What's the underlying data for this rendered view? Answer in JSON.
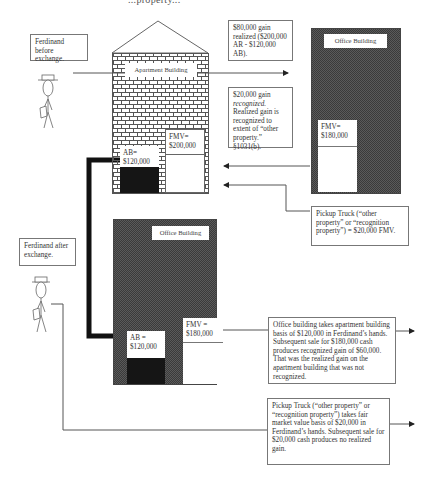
{
  "header": {
    "partial_title": "...property..."
  },
  "before": {
    "person_label": "Ferdinand before exchange.",
    "apartment": {
      "label": "Apartment Building",
      "fmv_label": "FMV=",
      "fmv_value": "$200,000",
      "ab_label": "AB=",
      "ab_value": "$120,000"
    },
    "office": {
      "label": "Office Building",
      "fmv_label": "FMV=",
      "fmv_value": "$180,000"
    },
    "realized_note": "$80,000 gain realized ($200,000 AR - $120,000 AB).",
    "recognized_note_amount": "$20,000 gain ",
    "recognized_note_em": "recognized.",
    "recognized_note_rest": " Realized gain is recognized to extent of “other property.” §1031(b).",
    "truck_note": "Pickup Truck (“other property” or “recognition property”) = $20,000 FMV."
  },
  "after": {
    "person_label": "Ferdinand after exchange.",
    "office": {
      "label": "Office Building",
      "fmv_label": "FMV =",
      "fmv_value": "$180,000",
      "ab_label": "AB =",
      "ab_value": "$120,000"
    },
    "office_note": "Office building takes apartment building basis of $120,000 in Ferdinand’s hands. Subsequent sale for $180,000 cash produces recognized gain of $60,000. That was the realized gain on the apartment building that was not recognized.",
    "truck_note": "Pickup Truck (“other property” or “recognition property”) takes fair market value basis of $20,000 in Ferdinand’s hands.  Subsequent sale for $20,000 cash produces no realized gain."
  },
  "colors": {
    "line": "#555555",
    "checker_dark": "#3a3a3a",
    "checker_light": "#5a5a5a",
    "basis_fill": "#151515",
    "box_border": "#777777"
  }
}
